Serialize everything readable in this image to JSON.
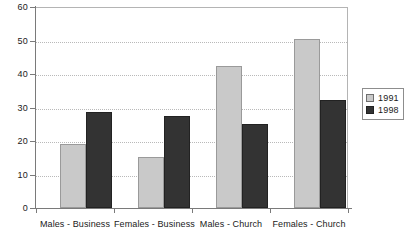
{
  "chart_data": {
    "type": "bar",
    "title": "",
    "subtitle": "",
    "xlabel": "",
    "ylabel": "",
    "ylim": [
      0,
      60
    ],
    "ytick_step": 10,
    "yticks": [
      "0",
      "10",
      "20",
      "30",
      "40",
      "50",
      "60"
    ],
    "grid": true,
    "legend_position": "right",
    "categories": [
      "Males - Business",
      "Females - Business",
      "Males - Church",
      "Females - Church"
    ],
    "series": [
      {
        "name": "1991",
        "color": "#c9c9c9",
        "values": [
          19,
          15.3,
          42.3,
          50.6
        ]
      },
      {
        "name": "1998",
        "color": "#333333",
        "values": [
          28.7,
          27.6,
          25,
          32.2
        ]
      }
    ]
  },
  "legend": {
    "items": [
      {
        "label": "1991",
        "swatch": "legend-swatch-1991"
      },
      {
        "label": "1998",
        "swatch": "legend-swatch-1998"
      }
    ]
  },
  "axes": {
    "y_axis_name": "y-axis",
    "x_axis_name": "x-axis"
  }
}
